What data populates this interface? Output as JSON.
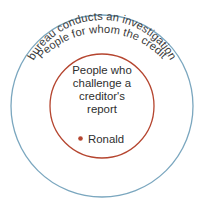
{
  "diagram": {
    "type": "euler-concentric",
    "background_color": "#ffffff",
    "outer_set": {
      "label_line_1": "People for whom the credit",
      "label_line_2": "bureau conducts an investigation",
      "stroke_color": "#7ba7bf",
      "stroke_width": 1.3,
      "center_x": 102,
      "center_y": 106,
      "radius": 91
    },
    "inner_set": {
      "label_lines": [
        "People who",
        "challenge a",
        "creditor's",
        "report"
      ],
      "stroke_color": "#b5452f",
      "stroke_width": 1.3,
      "center_x": 102,
      "center_y": 106,
      "radius": 52
    },
    "members": [
      {
        "name": "Ronald",
        "marker": "dot-marker",
        "marker_color": "#b5452f"
      }
    ],
    "text_color": "#333333"
  }
}
